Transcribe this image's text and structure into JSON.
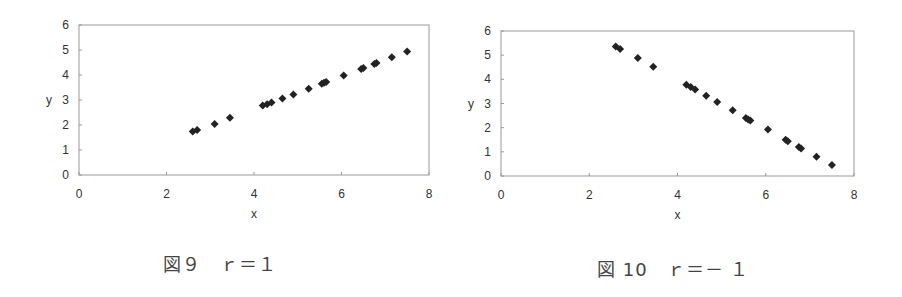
{
  "chart_data": [
    {
      "type": "scatter",
      "title": "",
      "caption": "図９　ｒ＝１",
      "xlabel": "x",
      "ylabel": "y",
      "xlim": [
        0,
        8
      ],
      "ylim": [
        0,
        6
      ],
      "xticks": [
        0,
        2,
        4,
        6,
        8
      ],
      "yticks": [
        0,
        1,
        2,
        3,
        4,
        5,
        6
      ],
      "grid": false,
      "legend": null,
      "marker": "diamond",
      "marker_color": "#222222",
      "points": [
        {
          "x": 2.6,
          "y": 1.74
        },
        {
          "x": 2.7,
          "y": 1.8
        },
        {
          "x": 3.1,
          "y": 2.04
        },
        {
          "x": 3.45,
          "y": 2.29
        },
        {
          "x": 4.2,
          "y": 2.78
        },
        {
          "x": 4.3,
          "y": 2.83
        },
        {
          "x": 4.4,
          "y": 2.9
        },
        {
          "x": 4.65,
          "y": 3.06
        },
        {
          "x": 4.9,
          "y": 3.22
        },
        {
          "x": 5.25,
          "y": 3.45
        },
        {
          "x": 5.55,
          "y": 3.65
        },
        {
          "x": 5.6,
          "y": 3.69
        },
        {
          "x": 5.65,
          "y": 3.72
        },
        {
          "x": 6.05,
          "y": 3.98
        },
        {
          "x": 6.45,
          "y": 4.24
        },
        {
          "x": 6.5,
          "y": 4.28
        },
        {
          "x": 6.75,
          "y": 4.44
        },
        {
          "x": 6.8,
          "y": 4.48
        },
        {
          "x": 7.15,
          "y": 4.71
        },
        {
          "x": 7.5,
          "y": 4.94
        }
      ]
    },
    {
      "type": "scatter",
      "title": "",
      "caption": "図 10　ｒ＝－ １",
      "xlabel": "x",
      "ylabel": "y",
      "xlim": [
        0,
        8
      ],
      "ylim": [
        0,
        6
      ],
      "xticks": [
        0,
        2,
        4,
        6,
        8
      ],
      "yticks": [
        0,
        1,
        2,
        3,
        4,
        5,
        6
      ],
      "grid": false,
      "legend": null,
      "marker": "diamond",
      "marker_color": "#222222",
      "points": [
        {
          "x": 2.6,
          "y": 5.36
        },
        {
          "x": 2.7,
          "y": 5.26
        },
        {
          "x": 3.1,
          "y": 4.88
        },
        {
          "x": 3.45,
          "y": 4.52
        },
        {
          "x": 4.2,
          "y": 3.78
        },
        {
          "x": 4.3,
          "y": 3.68
        },
        {
          "x": 4.4,
          "y": 3.58
        },
        {
          "x": 4.65,
          "y": 3.32
        },
        {
          "x": 4.9,
          "y": 3.06
        },
        {
          "x": 5.25,
          "y": 2.72
        },
        {
          "x": 5.55,
          "y": 2.4
        },
        {
          "x": 5.6,
          "y": 2.34
        },
        {
          "x": 5.65,
          "y": 2.3
        },
        {
          "x": 6.05,
          "y": 1.92
        },
        {
          "x": 6.45,
          "y": 1.5
        },
        {
          "x": 6.5,
          "y": 1.44
        },
        {
          "x": 6.75,
          "y": 1.2
        },
        {
          "x": 6.8,
          "y": 1.14
        },
        {
          "x": 7.15,
          "y": 0.8
        },
        {
          "x": 7.5,
          "y": 0.46
        }
      ]
    }
  ],
  "figures": [
    {
      "caption": "図９　ｒ＝１",
      "xlabel": "x",
      "ylabel": "y"
    },
    {
      "caption": "図 10　ｒ＝－ １",
      "xlabel": "x",
      "ylabel": "y"
    }
  ]
}
